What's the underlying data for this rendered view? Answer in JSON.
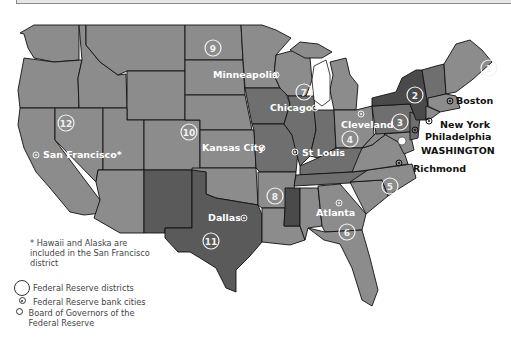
{
  "map": {
    "title": "Federal Reserve System",
    "colors": {
      "background": "#ffffff",
      "state_light": "#8c8c8c",
      "state_mid": "#7d7d7d",
      "state_dark": "#5a5a5a",
      "state_darkest": "#4a4a4a",
      "district_marker": "#f2f2f2",
      "border": "#111111"
    },
    "districts": [
      {
        "number": "1",
        "x": 489,
        "y": 68
      },
      {
        "number": "2",
        "x": 415,
        "y": 95
      },
      {
        "number": "3",
        "x": 400,
        "y": 122
      },
      {
        "number": "4",
        "x": 350,
        "y": 139
      },
      {
        "number": "5",
        "x": 390,
        "y": 186
      },
      {
        "number": "6",
        "x": 347,
        "y": 232
      },
      {
        "number": "7",
        "x": 304,
        "y": 92
      },
      {
        "number": "8",
        "x": 275,
        "y": 196
      },
      {
        "number": "9",
        "x": 213,
        "y": 48
      },
      {
        "number": "10",
        "x": 189,
        "y": 132
      },
      {
        "number": "11",
        "x": 211,
        "y": 241
      },
      {
        "number": "12",
        "x": 66,
        "y": 123
      }
    ],
    "cities": [
      {
        "name": "Boston",
        "x": 450,
        "y": 101,
        "label_x": 456,
        "label_y": 104,
        "style": "dark"
      },
      {
        "name": "New York",
        "x": 429,
        "y": 121,
        "label_x": 440,
        "label_y": 128,
        "style": "dark"
      },
      {
        "name": "Philadelphia",
        "x": 415,
        "y": 130,
        "label_x": 425,
        "label_y": 140,
        "style": "dark"
      },
      {
        "name": "WASHINGTON",
        "x": 402,
        "y": 141,
        "label_x": 421,
        "label_y": 154,
        "style": "dark",
        "is_board": true
      },
      {
        "name": "Richmond",
        "x": 399,
        "y": 163,
        "label_x": 413,
        "label_y": 172,
        "style": "dark"
      },
      {
        "name": "Cleveland",
        "x": 361,
        "y": 114,
        "label_x": 341,
        "label_y": 128,
        "style": "light"
      },
      {
        "name": "Chicago",
        "x": 315,
        "y": 108,
        "label_x": 270,
        "label_y": 111,
        "style": "light"
      },
      {
        "name": "Minneapolis",
        "x": 276,
        "y": 75,
        "label_x": 213,
        "label_y": 78,
        "style": "light"
      },
      {
        "name": "St Louis",
        "x": 295,
        "y": 152,
        "label_x": 302,
        "label_y": 156,
        "style": "light"
      },
      {
        "name": "Kansas City",
        "x": 262,
        "y": 148,
        "label_x": 202,
        "label_y": 151,
        "style": "light"
      },
      {
        "name": "Atlanta",
        "x": 339,
        "y": 203,
        "label_x": 316,
        "label_y": 216,
        "style": "light"
      },
      {
        "name": "Dallas",
        "x": 244,
        "y": 218,
        "label_x": 208,
        "label_y": 221,
        "style": "light"
      },
      {
        "name": "San Francisco*",
        "x": 36,
        "y": 155,
        "label_x": 43,
        "label_y": 158,
        "style": "light"
      }
    ],
    "footnote": "* Hawaii and Alaska are included in the San Francisco district",
    "legend": [
      {
        "icon": "large-circle-icon",
        "label": "Federal Reserve districts"
      },
      {
        "icon": "dotted-circle-icon",
        "label": "Federal Reserve bank cities"
      },
      {
        "icon": "small-circle-icon",
        "label": "Board of Governors of the Federal Reserve"
      }
    ]
  }
}
